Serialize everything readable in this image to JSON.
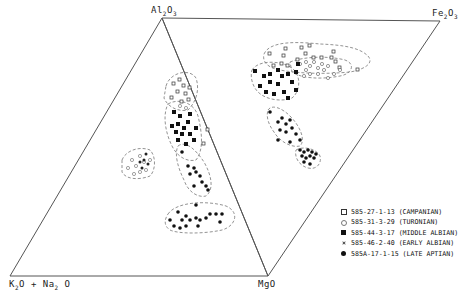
{
  "vertices": {
    "al2o3": {
      "label": "Al",
      "sub1": "2",
      "mid": "O",
      "sub2": "3"
    },
    "fe2o3": {
      "label": "Fe",
      "sub1": "2",
      "mid": "O",
      "sub2": "3"
    },
    "k2o_na2o": {
      "label": "K",
      "sub1": "2",
      "mid": "O + Na",
      "sub2": "2",
      "tail": " O"
    },
    "mgo": {
      "label": "MgO"
    }
  },
  "legend": [
    {
      "symbol": "open-square",
      "text": "585-27-1-13 (CAMPANIAN)"
    },
    {
      "symbol": "open-circle",
      "text": "585-31-3-29 (TURONIAN)"
    },
    {
      "symbol": "filled-square",
      "text": "585-44-3-17 (MIDDLE ALBIAN)"
    },
    {
      "symbol": "star",
      "text": "585-46-2-40 (EARLY ALBIAN)"
    },
    {
      "symbol": "filled-circle",
      "text": "585A-17-1-15 (LATE APTIAN)"
    }
  ],
  "colors": {
    "line": "#555555",
    "dashed": "#777777",
    "ink": "#111111"
  }
}
